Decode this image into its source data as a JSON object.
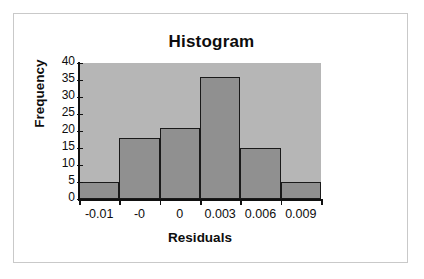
{
  "chart_data": {
    "type": "bar",
    "title": "Histogram",
    "xlabel": "Residuals",
    "ylabel": "Frequency",
    "categories": [
      "-0.01",
      "-0",
      "0",
      "0.003",
      "0.006",
      "0.009"
    ],
    "values": [
      5,
      18,
      21,
      36,
      15,
      5
    ],
    "ylim": [
      0,
      40
    ],
    "ytick_labels": [
      "0",
      "5",
      "10",
      "15",
      "20",
      "25",
      "30",
      "35",
      "40"
    ],
    "ytick_values": [
      0,
      5,
      10,
      15,
      20,
      25,
      30,
      35,
      40
    ],
    "grid": false,
    "legend": "none",
    "bar_gap": 0,
    "colors": {
      "bar_fill": "#909090",
      "bar_border": "#1a1a1a",
      "plot_background": "#b6b6b6",
      "frame_border": "#c9c9c9",
      "text": "#0d0d0d",
      "page_background": "#ffffff"
    }
  }
}
